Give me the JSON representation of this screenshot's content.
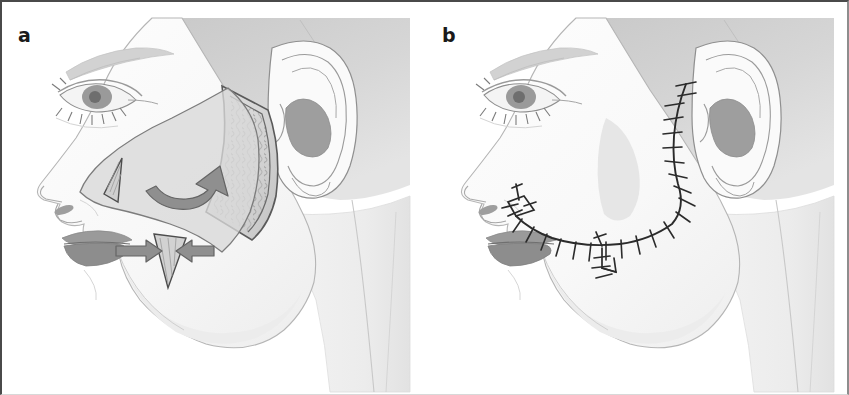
{
  "figure": {
    "width": 849,
    "height": 395,
    "background": "#ffffff",
    "border_color": "#4a4a4a",
    "type": "two-panel surgical illustration"
  },
  "panels": [
    {
      "id": "a",
      "label": "a",
      "caption": "Flap design with undermining and Burow's triangle excisions",
      "view": "left lateral facial profile, female",
      "elements": [
        {
          "name": "flap-outline",
          "description": "cheek advancement flap incision outline"
        },
        {
          "name": "undermined-subcutaneous-tissue",
          "description": "hatched adipose/subcutaneous texture beneath elevated flap margin"
        },
        {
          "name": "rotation-arrow",
          "description": "curved arrow indicating superolateral rotation vector"
        },
        {
          "name": "burow-triangle-superior",
          "description": "small triangle of excised skin at nasolabial/medial end"
        },
        {
          "name": "burow-triangle-inferior",
          "description": "inverted triangle of excised skin below flap"
        },
        {
          "name": "advancement-arrow-left",
          "description": "straight arrow pointing right toward triangle"
        },
        {
          "name": "advancement-arrow-right",
          "description": "straight arrow pointing left toward triangle"
        }
      ]
    },
    {
      "id": "b",
      "label": "b",
      "caption": "Postoperative closure with interrupted sutures",
      "view": "left lateral facial profile, female",
      "elements": [
        {
          "name": "suture-line",
          "description": "preauricular and submalar closure line with interrupted sutures"
        },
        {
          "name": "suture-count",
          "value": 26
        },
        {
          "name": "dog-ear-closure-medial",
          "description": "Y-shaped closure at medial nasolabial end"
        },
        {
          "name": "dog-ear-closure-inferior",
          "description": "Y-shaped closure at inferior cheek"
        }
      ]
    }
  ],
  "anatomy_labels": [
    "eye",
    "eyebrow",
    "eyelashes",
    "nose",
    "nostril",
    "upper-lip",
    "lower-lip",
    "chin",
    "jawline",
    "neck",
    "ear",
    "helix",
    "antihelix",
    "concha",
    "tragus",
    "lobule",
    "hairline",
    "temple"
  ],
  "palette": {
    "skin_light": "#fbfbfb",
    "skin_shadow": "#e9e9e9",
    "outline": "#8a8a8a",
    "outline_dark": "#555555",
    "flap_fill": "#d9d9d9",
    "flap_shadow": "#c4c4c4",
    "fat_texture": "#b9b9b9",
    "arrow_fill": "#8f8f8f",
    "arrow_stroke": "#6d6d6d",
    "lip_fill": "#9a9a9a",
    "lip_shadow": "#7f7f7f",
    "hair_gray": "#cfcfcf",
    "concha_dark": "#9e9e9e",
    "suture_ink": "#2b2b2b",
    "label_color": "#1a1a1a"
  }
}
